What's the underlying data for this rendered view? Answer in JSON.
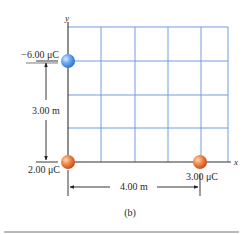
{
  "figure": {
    "caption": "(b)",
    "axes": {
      "x_label": "x",
      "y_label": "y"
    },
    "grid": {
      "color": "#6f9de0",
      "columns": 5,
      "rows": 4
    },
    "charges": [
      {
        "id": "q1",
        "label": "−6.00 μC",
        "color": "#5b9be8",
        "position": "on y-axis, 3.00 m above origin"
      },
      {
        "id": "q2",
        "label": "2.00 μC",
        "color": "#e8743a",
        "position": "origin"
      },
      {
        "id": "q3",
        "label": "3.00 μC",
        "color": "#e8743a",
        "position": "on x-axis, 4.00 m right of origin"
      }
    ],
    "dimensions": {
      "vertical": "3.00 m",
      "horizontal": "4.00 m"
    }
  }
}
